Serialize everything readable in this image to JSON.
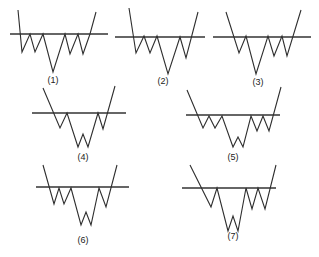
{
  "figure": {
    "colors": {
      "line": "#2e2e2e",
      "background": "#ffffff"
    },
    "panels": [
      {
        "label": "(1)",
        "neckline": {
          "x1": 10,
          "x2": 108,
          "y": 34
        },
        "path": [
          [
            18,
            10
          ],
          [
            22,
            52
          ],
          [
            30,
            34
          ],
          [
            35,
            52
          ],
          [
            43,
            34
          ],
          [
            53,
            72
          ],
          [
            65,
            34
          ],
          [
            70,
            54
          ],
          [
            78,
            34
          ],
          [
            83,
            54
          ],
          [
            90,
            34
          ],
          [
            96,
            12
          ]
        ],
        "label_pos": [
          53,
          83
        ]
      },
      {
        "label": "(2)",
        "neckline": {
          "x1": 115,
          "x2": 205,
          "y": 37
        },
        "path": [
          [
            129,
            8
          ],
          [
            136,
            53
          ],
          [
            144,
            36
          ],
          [
            150,
            53
          ],
          [
            157,
            36
          ],
          [
            168,
            74
          ],
          [
            180,
            37
          ],
          [
            186,
            58
          ],
          [
            198,
            12
          ]
        ],
        "label_pos": [
          163,
          84
        ]
      },
      {
        "label": "(3)",
        "neckline": {
          "x1": 213,
          "x2": 311,
          "y": 37
        },
        "path": [
          [
            226,
            12
          ],
          [
            239,
            53
          ],
          [
            246,
            36
          ],
          [
            256,
            74
          ],
          [
            268,
            36
          ],
          [
            274,
            56
          ],
          [
            282,
            36
          ],
          [
            287,
            56
          ],
          [
            301,
            10
          ]
        ],
        "label_pos": [
          258,
          85
        ]
      },
      {
        "label": "(4)",
        "neckline": {
          "x1": 32,
          "x2": 126,
          "y": 113
        },
        "path": [
          [
            43,
            88
          ],
          [
            60,
            128
          ],
          [
            67,
            113
          ],
          [
            78,
            147
          ],
          [
            83,
            134
          ],
          [
            88,
            147
          ],
          [
            98,
            113
          ],
          [
            103,
            129
          ],
          [
            115,
            86
          ]
        ],
        "label_pos": [
          83,
          160
        ]
      },
      {
        "label": "(5)",
        "neckline": {
          "x1": 186,
          "x2": 280,
          "y": 115
        },
        "path": [
          [
            187,
            90
          ],
          [
            203,
            128
          ],
          [
            209,
            116
          ],
          [
            215,
            128
          ],
          [
            222,
            116
          ],
          [
            233,
            147
          ],
          [
            238,
            137
          ],
          [
            243,
            147
          ],
          [
            251,
            116
          ],
          [
            257,
            131
          ],
          [
            263,
            116
          ],
          [
            269,
            131
          ],
          [
            281,
            87
          ]
        ],
        "label_pos": [
          233,
          160
        ]
      },
      {
        "label": "(6)",
        "neckline": {
          "x1": 36,
          "x2": 129,
          "y": 187
        },
        "path": [
          [
            43,
            165
          ],
          [
            54,
            204
          ],
          [
            59,
            188
          ],
          [
            64,
            204
          ],
          [
            71,
            188
          ],
          [
            81,
            225
          ],
          [
            86,
            212
          ],
          [
            91,
            225
          ],
          [
            99,
            188
          ],
          [
            106,
            207
          ],
          [
            117,
            165
          ]
        ],
        "label_pos": [
          83,
          243
        ]
      },
      {
        "label": "(7)",
        "neckline": {
          "x1": 182,
          "x2": 276,
          "y": 188
        },
        "path": [
          [
            190,
            165
          ],
          [
            211,
            207
          ],
          [
            217,
            188
          ],
          [
            228,
            231
          ],
          [
            233,
            216
          ],
          [
            238,
            231
          ],
          [
            246,
            188
          ],
          [
            252,
            209
          ],
          [
            258,
            188
          ],
          [
            265,
            209
          ],
          [
            276,
            165
          ]
        ],
        "label_pos": [
          233,
          239
        ]
      }
    ]
  }
}
